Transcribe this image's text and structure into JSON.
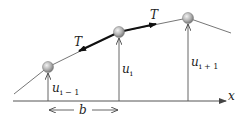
{
  "diagram": {
    "type": "string-of-beads",
    "labels": {
      "tension_left": "T",
      "tension_right": "T",
      "u_prev_base": "u",
      "u_prev_sub": "i − 1",
      "u_curr_base": "u",
      "u_curr_sub": "i",
      "u_next_base": "u",
      "u_next_sub": "i + 1",
      "spacing": "b",
      "axis": "x"
    },
    "masses": [
      {
        "id": "i-1",
        "x": 48,
        "y": 67
      },
      {
        "id": "i",
        "x": 119,
        "y": 32
      },
      {
        "id": "i+1",
        "x": 188,
        "y": 18
      }
    ],
    "colors": {
      "line": "#555555",
      "mass_light": "#e6e6e6",
      "mass_dark": "#7a7a7a",
      "tension": "#111111"
    }
  }
}
